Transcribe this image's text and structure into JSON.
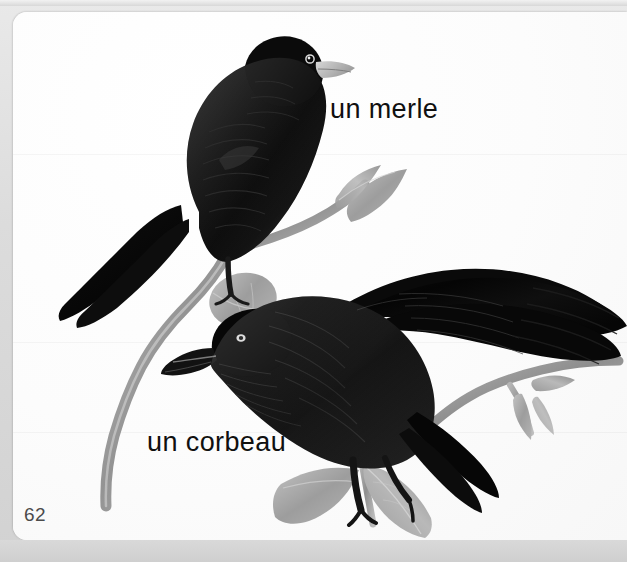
{
  "page": {
    "number": "62",
    "background_color": "#c9c9c9",
    "card_color": "#fdfdfd",
    "frame_color": "#dcdcdc"
  },
  "labels": [
    {
      "text": "un merle",
      "name": "label-merle",
      "x": 317,
      "y": 82
    },
    {
      "text": "un corbeau",
      "name": "label-corbeau",
      "x": 134,
      "y": 415
    }
  ],
  "label_merle": "un merle",
  "label_corbeau": "un corbeau",
  "illustration": {
    "caption_language": "French",
    "medium": "grayscale painted illustration",
    "subjects": [
      {
        "name": "merle",
        "english": "blackbird",
        "pose": "perched upright facing right",
        "body_color": "#0a0a0a",
        "beak_color": "#b8b8b8",
        "eye_color": "#e8e8e8"
      },
      {
        "name": "corbeau",
        "english": "crow",
        "pose": "horizontal with wings spread, head left",
        "body_color": "#060606",
        "beak_color": "#111111",
        "eye_color": "#d7d7d7"
      }
    ],
    "branch_color": "#9a9a9a",
    "leaf_color": "#a9a9a9"
  }
}
